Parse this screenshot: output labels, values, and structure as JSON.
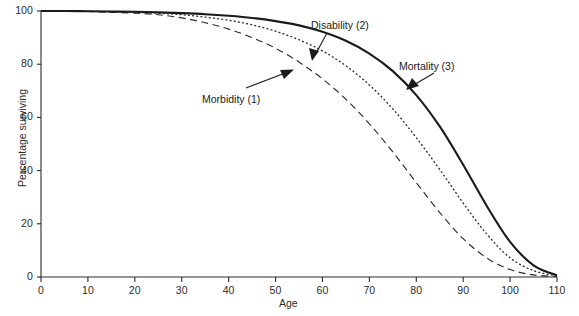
{
  "chart_data": {
    "type": "line",
    "title": "",
    "xlabel": "Age",
    "ylabel": "Percentage surviving",
    "xlim": [
      0,
      110
    ],
    "ylim": [
      0,
      100
    ],
    "xticks": [
      0,
      10,
      20,
      30,
      40,
      50,
      60,
      70,
      80,
      90,
      100,
      110
    ],
    "yticks": [
      0,
      20,
      40,
      60,
      80,
      100
    ],
    "grid": false,
    "legend_position": "inline-annotations",
    "x": [
      0,
      5,
      10,
      15,
      20,
      25,
      30,
      35,
      40,
      45,
      50,
      55,
      60,
      65,
      70,
      75,
      80,
      85,
      90,
      95,
      100,
      105,
      110
    ],
    "series": [
      {
        "name": "Morbidity (1)",
        "style": "long-dashed",
        "color": "#2b2b2b",
        "values": [
          100,
          100,
          99.8,
          99.5,
          99.2,
          98.6,
          97.4,
          95.6,
          93.2,
          90.0,
          86.0,
          80.8,
          74.5,
          66.8,
          57.6,
          47.0,
          35.5,
          24.2,
          14.4,
          7.2,
          2.8,
          0.8,
          0.2
        ]
      },
      {
        "name": "Disability (2)",
        "style": "dotted",
        "color": "#2b2b2b",
        "values": [
          100,
          100,
          99.9,
          99.7,
          99.5,
          99.2,
          98.6,
          97.7,
          96.5,
          94.8,
          92.4,
          89.2,
          85.0,
          79.4,
          72.2,
          63.2,
          52.4,
          40.4,
          27.8,
          16.2,
          7.2,
          2.4,
          0.4
        ]
      },
      {
        "name": "Mortality (3)",
        "style": "solid",
        "color": "#1a1a1a",
        "values": [
          100,
          100,
          99.9,
          99.8,
          99.7,
          99.5,
          99.2,
          98.8,
          98.2,
          97.4,
          96.2,
          94.6,
          92.2,
          88.8,
          84.0,
          77.4,
          68.4,
          56.6,
          42.2,
          26.8,
          13.2,
          4.4,
          0.6
        ]
      }
    ],
    "annotations": [
      {
        "text": "Morbidity (1)",
        "series": "Morbidity (1)",
        "at_age": 57,
        "at_value": 72
      },
      {
        "text": "Disability (2)",
        "series": "Disability (2)",
        "at_age": 60,
        "at_value": 80
      },
      {
        "text": "Mortality (3)",
        "series": "Mortality (3)",
        "at_age": 72,
        "at_value": 83
      }
    ]
  },
  "axes": {
    "x_tick_labels": [
      "0",
      "10",
      "20",
      "30",
      "40",
      "50",
      "60",
      "70",
      "80",
      "90",
      "100",
      "110"
    ],
    "y_tick_labels": [
      "0",
      "20",
      "40",
      "60",
      "80",
      "100"
    ],
    "x_title": "Age",
    "y_title": "Percentage surviving"
  },
  "labels": {
    "morbidity": "Morbidity (1)",
    "disability": "Disability (2)",
    "mortality": "Mortality (3)"
  },
  "colors": {
    "axis": "#2b2b2b",
    "curve_mortality": "#1a1a1a",
    "curve_disability": "#2b2b2b",
    "curve_morbidity": "#2b2b2b",
    "background": "#ffffff"
  }
}
